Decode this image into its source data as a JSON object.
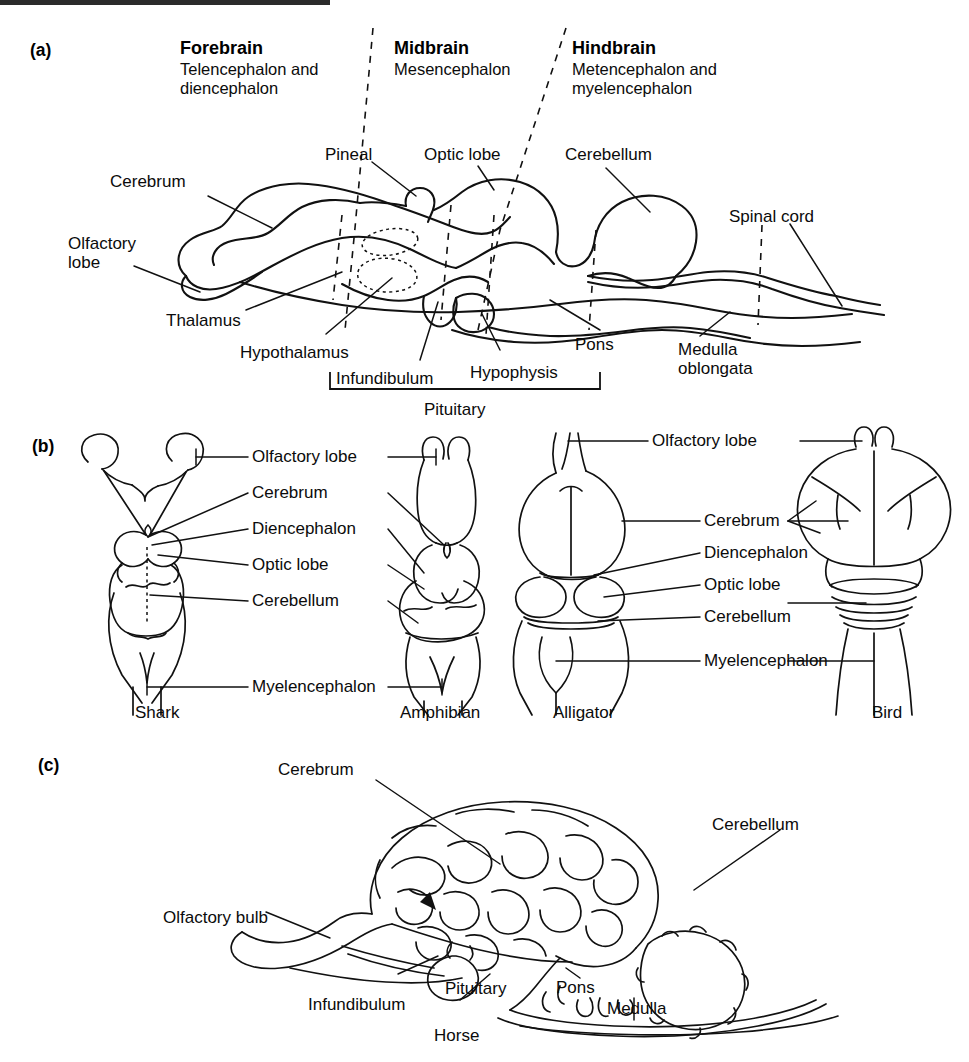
{
  "figure": {
    "panels": [
      "a",
      "b",
      "c"
    ]
  },
  "panel_a": {
    "tag": "(a)",
    "divisions": [
      {
        "title": "Forebrain",
        "subtitle": "Telencephalon and\ndiencephalon"
      },
      {
        "title": "Midbrain",
        "subtitle": "Mesencephalon"
      },
      {
        "title": "Hindbrain",
        "subtitle": "Metencephalon and\nmyelencephalon"
      }
    ],
    "labels": {
      "cerebrum": "Cerebrum",
      "olfactory_lobe": "Olfactory\nlobe",
      "thalamus": "Thalamus",
      "hypothalamus": "Hypothalamus",
      "infundibulum": "Infundibulum",
      "pineal": "Pineal",
      "optic_lobe": "Optic lobe",
      "cerebellum": "Cerebellum",
      "spinal_cord": "Spinal cord",
      "hypophysis": "Hypophysis",
      "pons": "Pons",
      "medulla_oblongata": "Medulla\noblongata",
      "pituitary": "Pituitary"
    }
  },
  "panel_b": {
    "tag": "(b)",
    "shared_labels": [
      "Olfactory lobe",
      "Cerebrum",
      "Diencephalon",
      "Optic lobe",
      "Cerebellum",
      "Myelencephalon"
    ],
    "left_group": {
      "species_left": "Shark",
      "species_right": "Amphibian"
    },
    "right_group": {
      "species_left": "Alligator",
      "species_right": "Bird"
    },
    "species": [
      "Shark",
      "Amphibian",
      "Alligator",
      "Bird"
    ]
  },
  "panel_c": {
    "tag": "(c)",
    "species": "Horse",
    "labels": {
      "cerebrum": "Cerebrum",
      "cerebellum": "Cerebellum",
      "olfactory_bulb": "Olfactory bulb",
      "infundibulum": "Infundibulum",
      "pituitary": "Pituitary",
      "pons": "Pons",
      "medulla": "Medulla"
    }
  },
  "colors": {
    "ink": "#111111",
    "background": "#ffffff"
  }
}
